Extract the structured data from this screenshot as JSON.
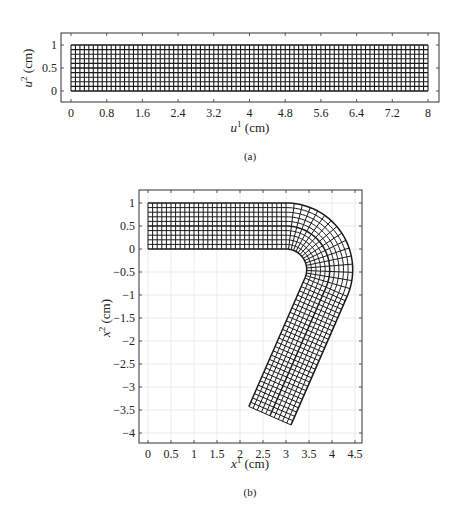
{
  "chart_data": [
    {
      "id": "a",
      "type": "mesh",
      "caption": "(a)",
      "title": "",
      "xlabel": "u¹ (cm)",
      "ylabel": "u² (cm)",
      "xlabel_parts": {
        "var": "u",
        "sup": "1",
        "unit": " (cm)"
      },
      "ylabel_parts": {
        "var": "u",
        "sup": "2",
        "unit": " (cm)"
      },
      "xlim": [
        -0.2,
        8.2
      ],
      "ylim": [
        -0.25,
        1.25
      ],
      "xticks": [
        0,
        0.8,
        1.6,
        2.4,
        3.2,
        4,
        4.8,
        5.6,
        6.4,
        7.2,
        8
      ],
      "xtick_labels": [
        "0",
        "0.8",
        "1.6",
        "2.4",
        "3.2",
        "4",
        "4.8",
        "5.6",
        "6.4",
        "7.2",
        "8"
      ],
      "yticks": [
        0,
        0.5,
        1
      ],
      "ytick_labels": [
        "0",
        "0.5",
        "1"
      ],
      "grid": false,
      "mesh": {
        "shape": "rectangle",
        "x_range": [
          0,
          8
        ],
        "y_range": [
          0,
          1
        ],
        "cols": 80,
        "rows": 10,
        "cell_size_cm": 0.1
      },
      "line_color": "#1a1a1a"
    },
    {
      "id": "b",
      "type": "mesh",
      "caption": "(b)",
      "title": "",
      "xlabel": "x¹ (cm)",
      "ylabel": "x² (cm)",
      "xlabel_parts": {
        "var": "x",
        "sup": "1",
        "unit": " (cm)"
      },
      "ylabel_parts": {
        "var": "x",
        "sup": "2",
        "unit": " (cm)"
      },
      "xlim": [
        -0.2,
        4.65
      ],
      "ylim": [
        -4.2,
        1.2
      ],
      "xticks": [
        0,
        0.5,
        1,
        1.5,
        2,
        2.5,
        3,
        3.5,
        4,
        4.5
      ],
      "xtick_labels": [
        "0",
        "0.5",
        "1",
        "1.5",
        "2",
        "2.5",
        "3",
        "3.5",
        "4",
        "4.5"
      ],
      "yticks": [
        1,
        0.5,
        0,
        -0.5,
        -1,
        -1.5,
        -2,
        -2.5,
        -3,
        -3.5,
        -4
      ],
      "ytick_labels": [
        "1",
        "0.5",
        "0",
        "−0.5",
        "−1",
        "−1.5",
        "−2",
        "−2.5",
        "−3",
        "−3.5",
        "−4"
      ],
      "grid": true,
      "mesh": {
        "shape": "bent-strip",
        "strip_width_cm": 1.0,
        "rows": 10,
        "straight_segment": {
          "x_range": [
            0,
            3.0
          ],
          "y_range": [
            0,
            1
          ],
          "cols": 30
        },
        "bend": {
          "center": [
            3.0,
            -0.45
          ],
          "inner_radius": 0.45,
          "outer_radius": 1.45,
          "start_angle_deg": 90,
          "end_angle_deg": -23.6,
          "cols": 16
        },
        "lower_leg": {
          "direction": [
            -0.4,
            -0.916
          ],
          "length_cm": 3.05,
          "cols": 30,
          "end_corners": [
            [
              2.28,
              -3.48
            ],
            [
              3.22,
              -3.89
            ]
          ]
        }
      },
      "line_color": "#1a1a1a",
      "grid_color": "#e6e6e6"
    }
  ]
}
